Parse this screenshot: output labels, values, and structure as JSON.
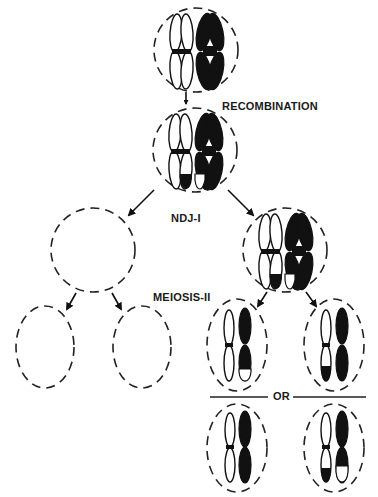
{
  "diagram": {
    "type": "meiosis-nondisjunction-schematic",
    "labels": {
      "recombination": "RECOMBINATION",
      "ndj": "NDJ-I",
      "meiosis2": "MEIOSIS-II",
      "or": "OR"
    },
    "stages": [
      {
        "id": "premeiotic-cell",
        "content": "homolog pair: open (white) and solid (black) bivalent"
      },
      {
        "id": "recombined-cell",
        "content": "bivalent after crossover; distal segments exchanged"
      },
      {
        "id": "ndj-empty-cell",
        "content": "empty (nullisomic) daughter cell"
      },
      {
        "id": "ndj-disomic-cell",
        "content": "both homologs segregated to one cell"
      },
      {
        "id": "meiosis2-empty-left",
        "content": "empty"
      },
      {
        "id": "meiosis2-empty-right",
        "content": "empty"
      },
      {
        "id": "meiosis2-disomic-a1",
        "content": "open chromatid + solid chromatid with open tip"
      },
      {
        "id": "meiosis2-disomic-a2",
        "content": "open chromatid with solid tip + solid chromatid"
      },
      {
        "id": "meiosis2-disomic-b1",
        "content": "open chromatid + solid chromatid"
      },
      {
        "id": "meiosis2-disomic-b2",
        "content": "open chromatid with solid tip + solid chromatid with open tip"
      }
    ],
    "colors": {
      "ink": "#111111",
      "background": "#ffffff"
    }
  }
}
